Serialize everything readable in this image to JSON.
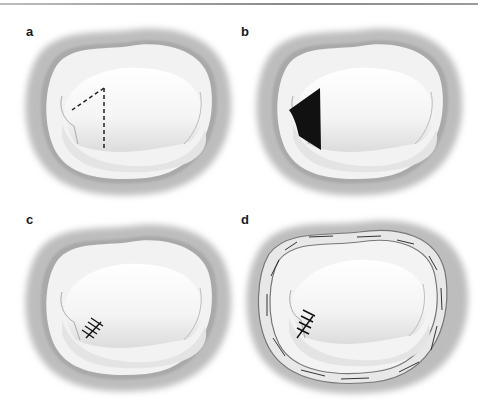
{
  "header": {
    "running_text": "Cardiothoracic Surgery Atlas"
  },
  "figure": {
    "type": "valve repair illustration",
    "panels": [
      {
        "id": "a",
        "label": "a",
        "description": "Valve with dashed triangular resection outline on posterior leaflet"
      },
      {
        "id": "b",
        "label": "b",
        "description": "Triangular resection defect shown in black"
      },
      {
        "id": "c",
        "label": "c",
        "description": "Leaflet repaired with interrupted sutures"
      },
      {
        "id": "d",
        "label": "d",
        "description": "Repair with annuloplasty ring sutured around annulus"
      }
    ]
  },
  "colors": {
    "ring_outer": "#bdbdbd",
    "ring_inner": "#9e9e9e",
    "leaflet": "#f7f7f7",
    "shadow": "#d8d8d8",
    "defect": "#111111",
    "annuloplasty_ring": "#e6e6e6"
  }
}
